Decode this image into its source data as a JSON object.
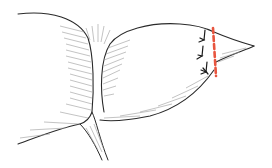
{
  "figure": {
    "colors": {
      "background": "#ffffff",
      "outline": "#2a2a2a",
      "hatching": "#9a9a9a",
      "cut_line": "#e8553f",
      "suture": "#1a1a1a"
    },
    "labels": []
  }
}
